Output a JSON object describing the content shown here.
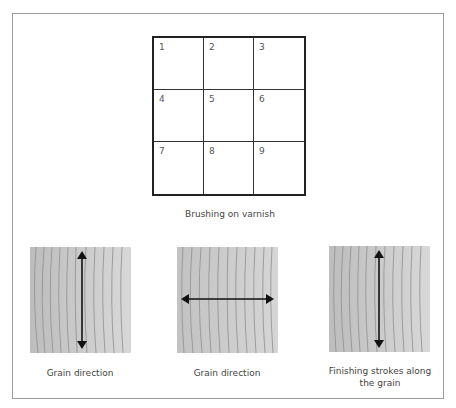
{
  "diagram": {
    "title": "Brushing on varnish",
    "grid": {
      "cells": [
        "1",
        "2",
        "3",
        "4",
        "5",
        "6",
        "7",
        "8",
        "9"
      ]
    },
    "panels": [
      {
        "caption": "Grain direction",
        "arrow": "vertical"
      },
      {
        "caption": "Grain direction",
        "arrow": "horizontal"
      },
      {
        "caption_line1": "Finishing strokes along",
        "caption_line2": "the grain",
        "arrow": "vertical"
      }
    ],
    "colors": {
      "wood_light": "#d4d4d4",
      "wood_dark": "#b8b8b8",
      "grain_line": "#8e8e8e",
      "arrow": "#111111",
      "frame": "#9a9a9a"
    }
  }
}
